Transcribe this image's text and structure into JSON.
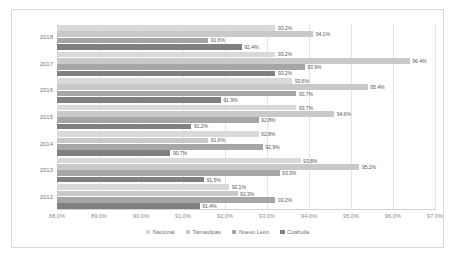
{
  "chart_data": {
    "type": "bar",
    "orientation": "horizontal",
    "title": "",
    "xlabel": "",
    "ylabel": "",
    "xlim": [
      88.0,
      97.0
    ],
    "grid": true,
    "legend_position": "bottom",
    "categories": [
      "2018",
      "2017",
      "2016",
      "2015",
      "2014",
      "2013",
      "2012"
    ],
    "xticks": [
      "88.0%",
      "89.0%",
      "90.0%",
      "91.0%",
      "92.0%",
      "93.0%",
      "94.0%",
      "95.0%",
      "96.0%",
      "97.0%"
    ],
    "xtick_values": [
      88.0,
      89.0,
      90.0,
      91.0,
      92.0,
      93.0,
      94.0,
      95.0,
      96.0,
      97.0
    ],
    "series": [
      {
        "name": "Nacional",
        "color": "#d9d9d9",
        "values": [
          93.2,
          93.2,
          93.6,
          93.7,
          92.8,
          93.8,
          92.1
        ],
        "labels": [
          "93.2%",
          "93.2%",
          "93.6%",
          "93.7%",
          "92.8%",
          "93.8%",
          "92.1%"
        ]
      },
      {
        "name": "Tamaulipas",
        "color": "#c9c9c9",
        "values": [
          94.1,
          96.4,
          95.4,
          94.6,
          91.6,
          95.2,
          92.3
        ],
        "labels": [
          "94.1%",
          "96.4%",
          "95.4%",
          "94.6%",
          "91.6%",
          "95.2%",
          "92.3%"
        ]
      },
      {
        "name": "Nuevo León",
        "color": "#a6a6a6",
        "values": [
          91.6,
          93.9,
          93.7,
          92.8,
          92.9,
          93.3,
          93.2
        ],
        "labels": [
          "91.6%",
          "93.9%",
          "93.7%",
          "92.8%",
          "92.9%",
          "93.3%",
          "93.2%"
        ]
      },
      {
        "name": "Coahuila",
        "color": "#808080",
        "values": [
          92.4,
          93.2,
          91.9,
          91.2,
          90.7,
          91.5,
          91.4
        ],
        "labels": [
          "92.4%",
          "93.2%",
          "91.9%",
          "91.2%",
          "90.7%",
          "91.5%",
          "91.4%"
        ]
      }
    ]
  }
}
